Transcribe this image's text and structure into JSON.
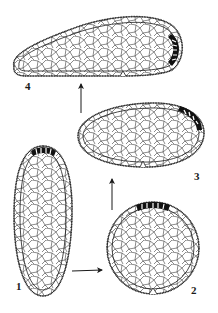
{
  "figure": {
    "type": "developmental-sequence-diagram",
    "background": "#ffffff",
    "ink_color": "#1a1a1a",
    "stages": [
      {
        "id": "1",
        "label": "1",
        "shape": "elongated-oval-vertical",
        "dark_cap": "top",
        "notch": false
      },
      {
        "id": "2",
        "label": "2",
        "shape": "circle",
        "dark_cap": "top",
        "notch": true
      },
      {
        "id": "3",
        "label": "3",
        "shape": "egg-horizontal",
        "dark_cap": "upper-right",
        "notch": true
      },
      {
        "id": "4",
        "label": "4",
        "shape": "elongated-teardrop-horizontal",
        "dark_cap": "right",
        "notch": true
      }
    ],
    "arrows": [
      {
        "from": "1",
        "to": "2",
        "direction": "right"
      },
      {
        "from": "2",
        "to": "3",
        "direction": "up"
      },
      {
        "from": "3",
        "to": "4",
        "direction": "up"
      }
    ]
  }
}
